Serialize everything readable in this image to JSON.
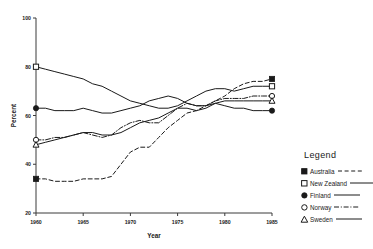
{
  "chart_data": {
    "type": "line",
    "title": "",
    "xlabel": "Year",
    "ylabel": "Percent",
    "xlim": [
      1960,
      1985
    ],
    "ylim": [
      20,
      100
    ],
    "xticks": [
      1960,
      1965,
      1970,
      1975,
      1980,
      1985
    ],
    "yticks": [
      20,
      40,
      60,
      80,
      100
    ],
    "grid": false,
    "legend_position": "right",
    "legend_title": "Legend",
    "x": [
      1960,
      1961,
      1962,
      1963,
      1964,
      1965,
      1966,
      1967,
      1968,
      1969,
      1970,
      1971,
      1972,
      1973,
      1974,
      1975,
      1976,
      1977,
      1978,
      1979,
      1980,
      1981,
      1982,
      1983,
      1984,
      1985
    ],
    "series": [
      {
        "name": "Australia",
        "marker": "filled-square",
        "line_style": "dashed",
        "values": [
          34,
          34,
          33,
          33,
          33,
          34,
          34,
          34,
          35,
          40,
          45,
          47,
          47,
          51,
          55,
          58,
          61,
          62,
          64,
          66,
          68,
          71,
          73,
          74,
          74,
          75
        ]
      },
      {
        "name": "New Zealand",
        "marker": "open-square",
        "line_style": "solid",
        "values": [
          80,
          79,
          78,
          77,
          76,
          75,
          73,
          72,
          70,
          68,
          66,
          65,
          64,
          63,
          63,
          64,
          66,
          68,
          70,
          71,
          71,
          70,
          71,
          72,
          72,
          72
        ]
      },
      {
        "name": "Finland",
        "marker": "filled-circle",
        "line_style": "solid",
        "values": [
          63,
          63,
          62,
          62,
          62,
          63,
          62,
          61,
          61,
          62,
          63,
          64,
          66,
          67,
          68,
          67,
          65,
          64,
          64,
          65,
          64,
          63,
          63,
          62,
          62,
          62
        ]
      },
      {
        "name": "Norway",
        "marker": "open-circle",
        "line_style": "dash-dot",
        "values": [
          50,
          50,
          51,
          51,
          52,
          53,
          52,
          51,
          52,
          55,
          57,
          58,
          57,
          57,
          60,
          63,
          65,
          64,
          64,
          66,
          67,
          67,
          67,
          68,
          68,
          68
        ]
      },
      {
        "name": "Sweden",
        "marker": "open-triangle",
        "line_style": "solid",
        "values": [
          48,
          49,
          50,
          51,
          52,
          53,
          53,
          52,
          52,
          53,
          55,
          57,
          58,
          59,
          61,
          63,
          63,
          62,
          63,
          65,
          66,
          66,
          66,
          66,
          66,
          66
        ]
      }
    ]
  },
  "axis": {
    "ylabel": "Percent",
    "xlabel": "Year",
    "yticks": [
      "100",
      "80",
      "60",
      "40",
      "20"
    ],
    "xticks": [
      "1960",
      "1965",
      "1970",
      "1975",
      "1980",
      "1985"
    ]
  },
  "legend": {
    "title": "Legend",
    "items": [
      {
        "label": "Australia",
        "marker": "filled-square",
        "line_style": "dashed"
      },
      {
        "label": "New Zealand",
        "marker": "open-square",
        "line_style": "solid"
      },
      {
        "label": "Finland",
        "marker": "filled-circle",
        "line_style": "solid"
      },
      {
        "label": "Norway",
        "marker": "open-circle",
        "line_style": "dash-dot"
      },
      {
        "label": "Sweden",
        "marker": "open-triangle",
        "line_style": "solid"
      }
    ]
  }
}
